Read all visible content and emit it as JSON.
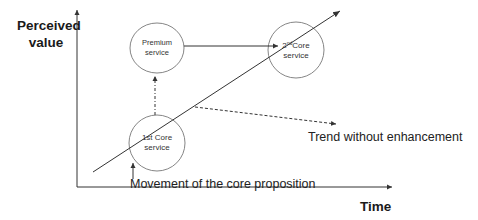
{
  "diagram": {
    "axes": {
      "y_label_line1": "Perceived",
      "y_label_line2": "value",
      "x_label": "Time"
    },
    "nodes": {
      "premium": {
        "line1": "Premium",
        "line2": "service"
      },
      "core2": {
        "ordinal": "2",
        "sup": "nd",
        "line1_rest": "Core",
        "line2": "service"
      },
      "core1": {
        "line1": "1st Core",
        "line2": "service"
      }
    },
    "annotations": {
      "trend": "Trend without enhancement",
      "movement": "Movement of the core proposition"
    },
    "colors": {
      "line": "#333333",
      "circle": "#777777",
      "text": "#222222"
    }
  }
}
